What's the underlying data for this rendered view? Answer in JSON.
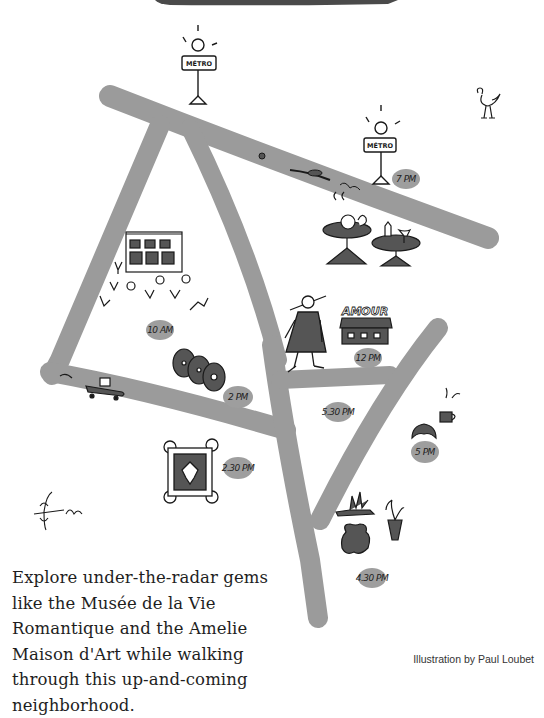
{
  "header": {
    "banner_color": "#4a4a4a"
  },
  "colors": {
    "road": "#9b9b9b",
    "pill": "#9e9e9e",
    "ink": "#1a1a1a",
    "fill_dark": "#555555"
  },
  "map": {
    "metro_signs": [
      {
        "id": "metro-1",
        "label": "MÉTRO"
      },
      {
        "id": "metro-2",
        "label": "MÉTRO"
      }
    ],
    "shop_sign": "AMOUR",
    "time_markers": [
      {
        "id": "time-10am",
        "label": "10 AM"
      },
      {
        "id": "time-12pm",
        "label": "12 PM"
      },
      {
        "id": "time-2pm",
        "label": "2 PM"
      },
      {
        "id": "time-230pm",
        "label": "2.30 PM"
      },
      {
        "id": "time-430pm",
        "label": "4.30 PM"
      },
      {
        "id": "time-5pm",
        "label": "5 PM"
      },
      {
        "id": "time-530pm",
        "label": "5.30 PM"
      },
      {
        "id": "time-7pm",
        "label": "7 PM"
      }
    ]
  },
  "caption": {
    "text": "Explore under-the-radar gems like the Musée de la Vie Romantique and the Amelie Maison d'Art while walking through this up-and-coming neighborhood."
  },
  "credit": {
    "text": "Illustration by Paul Loubet"
  }
}
